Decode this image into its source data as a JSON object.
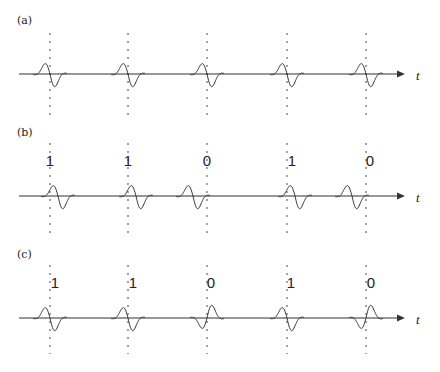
{
  "figure": {
    "slot_positions_x": [
      50,
      128,
      207,
      287,
      366
    ],
    "axis_label": "t",
    "colors": {
      "ink": "#333333",
      "background": "#ffffff"
    },
    "panels": [
      {
        "id": "a",
        "label": "(a)",
        "axis_y": 74,
        "bits": [],
        "modulation": "none",
        "pulses": [
          {
            "slot": 0,
            "shift": 0,
            "polarity": 1
          },
          {
            "slot": 1,
            "shift": 0,
            "polarity": 1
          },
          {
            "slot": 2,
            "shift": 0,
            "polarity": 1
          },
          {
            "slot": 3,
            "shift": 0,
            "polarity": 1
          },
          {
            "slot": 4,
            "shift": 0,
            "polarity": 1
          }
        ]
      },
      {
        "id": "b",
        "label": "(b)",
        "axis_y": 196,
        "bits": [
          "1",
          "1",
          "0",
          "1",
          "0"
        ],
        "modulation": "pulse-position",
        "pulses": [
          {
            "slot": 0,
            "shift": 8,
            "polarity": 1
          },
          {
            "slot": 1,
            "shift": 8,
            "polarity": 1
          },
          {
            "slot": 2,
            "shift": -14,
            "polarity": 1
          },
          {
            "slot": 3,
            "shift": 8,
            "polarity": 1
          },
          {
            "slot": 4,
            "shift": -14,
            "polarity": 1
          }
        ]
      },
      {
        "id": "c",
        "label": "(c)",
        "axis_y": 318,
        "bits": [
          "1",
          "1",
          "0",
          "1",
          "0"
        ],
        "modulation": "polarity",
        "pulses": [
          {
            "slot": 0,
            "shift": 0,
            "polarity": 1
          },
          {
            "slot": 1,
            "shift": 0,
            "polarity": 1
          },
          {
            "slot": 2,
            "shift": 0,
            "polarity": -1
          },
          {
            "slot": 3,
            "shift": 0,
            "polarity": 1
          },
          {
            "slot": 4,
            "shift": 0,
            "polarity": -1
          }
        ]
      }
    ]
  }
}
